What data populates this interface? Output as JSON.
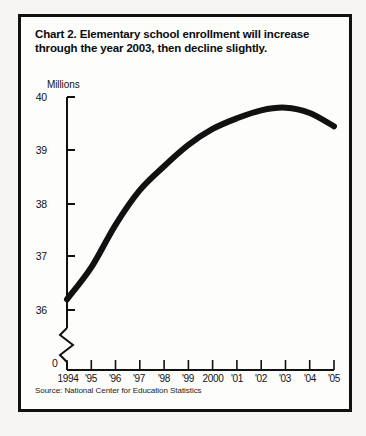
{
  "figure": {
    "title": "Chart 2. Elementary school enrollment will increase through the year 2003, then decline slightly.",
    "source": "Source: National Center for Education Statistics",
    "origin_label": "0"
  },
  "colors": {
    "line": "#111111",
    "axis": "#111111",
    "frame": "#111111",
    "page_background": "#f6f5f3",
    "panel_background": "#fdfdfc"
  },
  "chart_data": {
    "type": "line",
    "title": "Chart 2. Elementary school enrollment will increase through the year 2003, then decline slightly.",
    "subtitle": "",
    "xlabel": "",
    "ylabel": "Millions",
    "ylim": [
      35.75,
      40
    ],
    "ytick_values": [
      36,
      37,
      38,
      39,
      40
    ],
    "ytick_labels": [
      "36",
      "37",
      "38",
      "39",
      "40"
    ],
    "axis_break": true,
    "axis_break_note": "y-axis broken below 36",
    "grid": false,
    "legend": false,
    "x": [
      1994,
      1995,
      1996,
      1997,
      1998,
      1999,
      2000,
      2001,
      2002,
      2003,
      2004,
      2005
    ],
    "categories": [
      "1994",
      "'95",
      "'96",
      "'97",
      "'98",
      "'99",
      "2000",
      "'01",
      "'02",
      "'03",
      "'04",
      "'05"
    ],
    "xtick_labels": [
      "1994",
      "'95",
      "'96",
      "'97",
      "'98",
      "'99",
      "2000",
      "'01",
      "'02",
      "'03",
      "'04",
      "'05"
    ],
    "series": [
      {
        "name": "Elementary school enrollment",
        "units": "Millions",
        "values": [
          36.2,
          36.8,
          37.6,
          38.25,
          38.7,
          39.1,
          39.4,
          39.6,
          39.75,
          39.8,
          39.7,
          39.45
        ]
      }
    ],
    "annotations": []
  }
}
